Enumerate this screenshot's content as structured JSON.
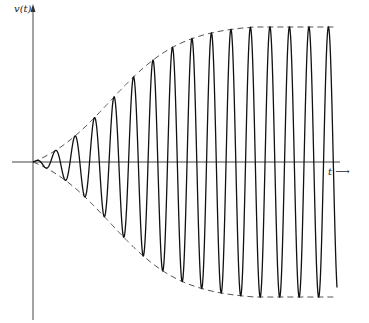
{
  "chart_data": {
    "type": "line",
    "title": "",
    "xlabel": "t",
    "ylabel": "v(t)",
    "x_arrow_label": "t ⟶",
    "grid": false,
    "legend": null,
    "series": [
      {
        "name": "v(t)",
        "style": "solid",
        "kind": "oscillation",
        "cycles_visible": 15.5
      },
      {
        "name": "upper envelope",
        "style": "dashed",
        "kind": "logistic"
      },
      {
        "name": "lower envelope",
        "style": "dashed",
        "kind": "logistic (mirrored)"
      }
    ],
    "envelope_samples_normalized": {
      "t": [
        0,
        0.1,
        0.2,
        0.3,
        0.4,
        0.5,
        0.6,
        0.7,
        0.8,
        0.9,
        1.0
      ],
      "amplitude": [
        0.0,
        0.12,
        0.31,
        0.6,
        0.79,
        0.9,
        0.96,
        0.99,
        1.0,
        1.0,
        1.0
      ]
    },
    "ylim": [
      -1,
      1
    ],
    "xlim": [
      0,
      1
    ]
  },
  "layout": {
    "origin_px": [
      33,
      162
    ],
    "x_axis_end_px": 340,
    "y_axis_top_px": 3,
    "y_axis_bottom_px": 320,
    "x_axis_start_px": 12,
    "amp_max_px": 135,
    "period_px": 19.5,
    "curve_end_px": 337,
    "envelope_end_px": 337,
    "sigmoid_center_px": 110,
    "sigmoid_scale_px": 36
  },
  "labels": {
    "y": "v(t)",
    "x": "t ⟶"
  }
}
